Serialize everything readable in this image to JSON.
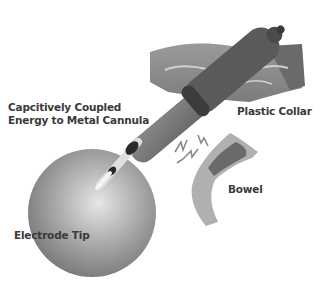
{
  "diagram": {
    "labels": {
      "capacitive_line1": "Capcitively Coupled",
      "capacitive_line2": "Energy to Metal Cannula",
      "plastic_collar": "Plastic Collar",
      "bowel": "Bowel",
      "electrode_tip": "Electrode Tip"
    },
    "components": [
      "abdominal-wall",
      "plastic-collar",
      "metal-cannula",
      "electrode-shaft",
      "electrode-tip",
      "bowel",
      "energy-sparks",
      "sphere"
    ],
    "colors": {
      "background": "#ffffff",
      "text": "#3a3a3a",
      "cannula": "#6e6e6e",
      "collar": "#555555",
      "sphere": "#9a9a9a",
      "bowel": "#a8a8a8",
      "bowel_dark": "#6a6a6a",
      "wall": "#8a8a8a"
    }
  }
}
